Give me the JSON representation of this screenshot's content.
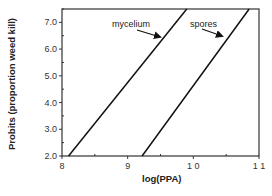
{
  "chart_data": {
    "type": "line",
    "title": "",
    "xlabel": "log(PPA)",
    "ylabel": "Probits (proportion weed kill)",
    "xlim": [
      8,
      11
    ],
    "ylim": [
      2.0,
      7.5
    ],
    "x_ticks": [
      8,
      9,
      10,
      11
    ],
    "x_tick_labels": [
      "8",
      "9",
      "1 0",
      "1 1"
    ],
    "y_ticks": [
      2.0,
      3.0,
      4.0,
      5.0,
      6.0,
      7.0
    ],
    "y_tick_labels": [
      "2.0",
      "3.0",
      "4.0",
      "5.0",
      "6.0",
      "7.0"
    ],
    "grid": false,
    "legend": "none (inline arrow annotations)",
    "series": [
      {
        "name": "mycelium",
        "x": [
          8.1,
          9.9
        ],
        "y": [
          2.0,
          7.5
        ]
      },
      {
        "name": "spores",
        "x": [
          9.22,
          10.85
        ],
        "y": [
          2.0,
          7.5
        ]
      }
    ],
    "annotations": [
      {
        "text": "mycelium",
        "points_to": "mycelium"
      },
      {
        "text": "spores",
        "points_to": "spores"
      }
    ]
  }
}
